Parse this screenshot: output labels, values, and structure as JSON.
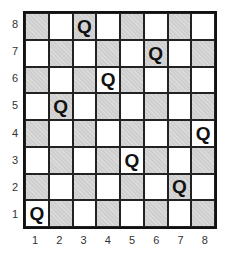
{
  "board": {
    "size": 8,
    "bottom_left_color": "light",
    "colors": {
      "dark": "#cfcfcf",
      "light": "#ffffff",
      "line": "#222222"
    },
    "piece_label": "Q",
    "queens": [
      {
        "file": 1,
        "rank": 1
      },
      {
        "file": 2,
        "rank": 5
      },
      {
        "file": 3,
        "rank": 8
      },
      {
        "file": 4,
        "rank": 6
      },
      {
        "file": 5,
        "rank": 3
      },
      {
        "file": 6,
        "rank": 7
      },
      {
        "file": 7,
        "rank": 2
      },
      {
        "file": 8,
        "rank": 4
      }
    ]
  },
  "labels": {
    "ranks": [
      "8",
      "7",
      "6",
      "5",
      "4",
      "3",
      "2",
      "1"
    ],
    "files": [
      "1",
      "2",
      "3",
      "4",
      "5",
      "6",
      "7",
      "8"
    ]
  }
}
